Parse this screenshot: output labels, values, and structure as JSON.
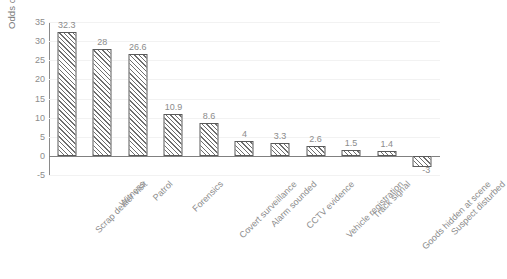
{
  "chart_data": {
    "type": "bar",
    "title": "",
    "xlabel": "",
    "ylabel": "Odds of detection",
    "ylim": [
      -5,
      35
    ],
    "yticks": [
      35,
      30,
      25,
      20,
      15,
      10,
      5,
      0,
      -5
    ],
    "grid": true,
    "legend": false,
    "categories": [
      "Scrap dealer visit",
      "Witness",
      "Patrol",
      "Forensics",
      "Covert surveillance",
      "Alarm sounded",
      "CCTV evidence",
      "Vehicle registration",
      "Track signal",
      "Goods hidden at scene",
      "Suspect disturbed"
    ],
    "values": [
      32.3,
      28,
      26.6,
      10.9,
      8.6,
      4,
      3.3,
      2.6,
      1.5,
      1.4,
      -3
    ],
    "value_labels": [
      "32.3",
      "28",
      "26.6",
      "10.9",
      "8.6",
      "4",
      "3.3",
      "2.6",
      "1.5",
      "1.4",
      "-3"
    ],
    "bar_style": {
      "fill": "#ffffff",
      "hatch": "diagonal",
      "border": "#5a5a5a",
      "hatch_color": "#6e6e6e"
    },
    "colors": {
      "gridline": "#f2f2f2",
      "axis": "#8a8a8a",
      "zero_line": "#808080",
      "text": "#8c8c8c",
      "background": "#ffffff"
    }
  }
}
